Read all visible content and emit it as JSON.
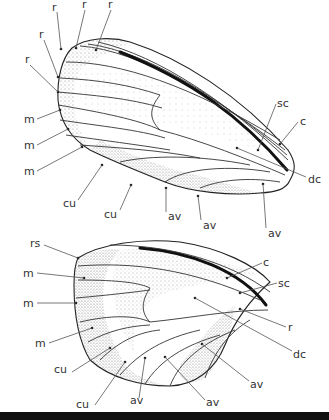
{
  "figure": {
    "forewing": {
      "labels": [
        {
          "id": "r1",
          "text": "r",
          "x": 68,
          "y": 11
        },
        {
          "id": "r2",
          "text": "r",
          "x": 83,
          "y": 7
        },
        {
          "id": "r3",
          "text": "r",
          "x": 109,
          "y": 8
        },
        {
          "id": "r4",
          "text": "r",
          "x": 40,
          "y": 37
        },
        {
          "id": "r5",
          "text": "r",
          "x": 26,
          "y": 62
        },
        {
          "id": "m1",
          "text": "m",
          "x": 25,
          "y": 124
        },
        {
          "id": "m2",
          "text": "m",
          "x": 25,
          "y": 150
        },
        {
          "id": "m3",
          "text": "m",
          "x": 25,
          "y": 176
        },
        {
          "id": "cu1",
          "text": "cu",
          "x": 62,
          "y": 207
        },
        {
          "id": "cu2",
          "text": "cu",
          "x": 104,
          "y": 218
        },
        {
          "id": "av1",
          "text": "av",
          "x": 168,
          "y": 220
        },
        {
          "id": "av2",
          "text": "av",
          "x": 203,
          "y": 228
        },
        {
          "id": "av3",
          "text": "av",
          "x": 268,
          "y": 236
        },
        {
          "id": "sc",
          "text": "sc",
          "x": 278,
          "y": 107
        },
        {
          "id": "c",
          "text": "c",
          "x": 300,
          "y": 125
        },
        {
          "id": "dc",
          "text": "dc",
          "x": 309,
          "y": 181
        }
      ]
    },
    "hindwing": {
      "labels": [
        {
          "id": "rs",
          "text": "rs",
          "x": 32,
          "y": 247
        },
        {
          "id": "m1",
          "text": "m",
          "x": 24,
          "y": 275
        },
        {
          "id": "m2",
          "text": "m",
          "x": 24,
          "y": 305
        },
        {
          "id": "m3",
          "text": "m",
          "x": 36,
          "y": 345
        },
        {
          "id": "cu1",
          "text": "cu",
          "x": 54,
          "y": 371
        },
        {
          "id": "cu2",
          "text": "cu",
          "x": 76,
          "y": 407
        },
        {
          "id": "av1",
          "text": "av",
          "x": 130,
          "y": 402
        },
        {
          "id": "av2",
          "text": "av",
          "x": 206,
          "y": 405
        },
        {
          "id": "av3",
          "text": "av",
          "x": 250,
          "y": 386
        },
        {
          "id": "c",
          "text": "c",
          "x": 263,
          "y": 265
        },
        {
          "id": "sc",
          "text": "sc",
          "x": 278,
          "y": 286
        },
        {
          "id": "r",
          "text": "r",
          "x": 288,
          "y": 330
        },
        {
          "id": "dc",
          "text": "dc",
          "x": 293,
          "y": 356
        }
      ]
    }
  }
}
